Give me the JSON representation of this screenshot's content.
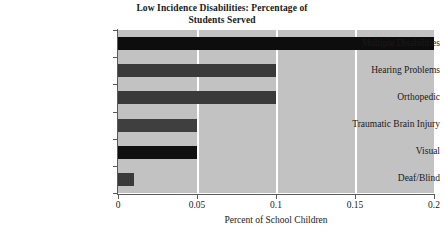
{
  "chart_data": {
    "type": "bar",
    "orientation": "horizontal",
    "title": "Low Incidence Disabilities: Percentage of Students Served",
    "title_lines": [
      "Low Incidence Disabilities: Percentage of",
      "Students Served"
    ],
    "xlabel": "Percent of School Children",
    "ylabel": "",
    "categories": [
      "Multiple Disabilities",
      "Hearing Problems",
      "Orthopedic",
      "Traumatic Brain Injury",
      "Visual",
      "Deaf/Blind"
    ],
    "values": [
      0.2,
      0.1,
      0.1,
      0.05,
      0.05,
      0.01
    ],
    "bar_colors": [
      "#0d0d0d",
      "#3a3a3a",
      "#3a3a3a",
      "#3f3f3f",
      "#101010",
      "#3a3a3a"
    ],
    "xlim": [
      0,
      0.2
    ],
    "xticks": [
      0,
      0.05,
      0.1,
      0.15,
      0.2
    ],
    "xtick_labels": [
      "0",
      "0.05",
      "0.1",
      "0.15",
      "0.2"
    ],
    "grid": "vertical-white",
    "legend": null,
    "plot_background": "#c2c2c2",
    "figure_background": "#ffffff",
    "axis_color": "#5a5a5a"
  }
}
